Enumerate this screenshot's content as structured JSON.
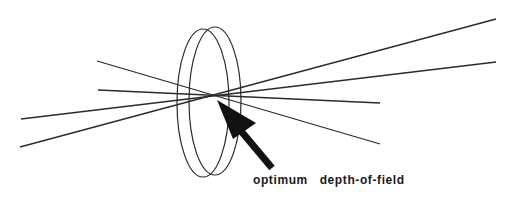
{
  "diagram": {
    "label": "optimum   depth-of-field",
    "colors": {
      "line": "#2a2a2a",
      "background": "#ffffff"
    },
    "elements": [
      "lens (double ellipse)",
      "converging light rays",
      "arrow pointing to focal point"
    ]
  }
}
